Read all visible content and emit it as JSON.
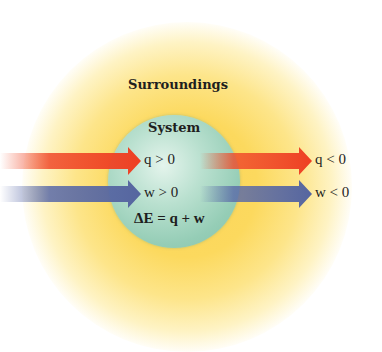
{
  "diagram": {
    "type": "thermodynamics-system-surroundings",
    "surroundings_label": "Surroundings",
    "system_label": "System",
    "equation": "ΔE = q + w",
    "inputs": [
      {
        "name": "heat-in",
        "label": "q > 0",
        "color": "#f04a2a"
      },
      {
        "name": "work-in",
        "label": "w > 0",
        "color": "#5a6aa8"
      }
    ],
    "outputs": [
      {
        "name": "heat-out",
        "label": "q < 0",
        "color": "#f04a2a"
      },
      {
        "name": "work-out",
        "label": "w < 0",
        "color": "#5a6aa8"
      }
    ],
    "colors": {
      "surroundings": "#fbd45a",
      "system": "#a8d8c4",
      "heat_arrow": "#f04a2a",
      "work_arrow": "#5a6aa8"
    }
  }
}
